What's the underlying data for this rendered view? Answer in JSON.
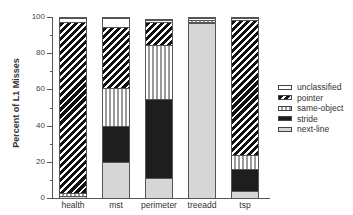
{
  "chart_data": {
    "type": "bar",
    "stacked": true,
    "title": "",
    "xlabel": "",
    "ylabel": "Percent of L1 Misses",
    "ylim": [
      0,
      100
    ],
    "yticks": [
      0,
      20,
      40,
      60,
      80,
      100
    ],
    "grid": false,
    "legend_position": "right",
    "categories": [
      "health",
      "mst",
      "perimeter",
      "treeadd",
      "tsp"
    ],
    "series": [
      {
        "name": "next-line",
        "values": [
          1,
          20,
          11,
          97,
          4
        ]
      },
      {
        "name": "stride",
        "values": [
          0,
          20,
          44,
          1,
          12
        ]
      },
      {
        "name": "same-object",
        "values": [
          2,
          21,
          30,
          1,
          8
        ]
      },
      {
        "name": "pointer",
        "values": [
          95,
          34,
          13,
          0,
          75
        ]
      },
      {
        "name": "unclassified",
        "values": [
          2,
          5,
          1,
          1,
          1
        ]
      }
    ],
    "legend": [
      "unclassified",
      "pointer",
      "same-object",
      "stride",
      "next-line"
    ]
  },
  "axis": {
    "ylabel": "Percent of L1 Misses",
    "yticks": [
      "0",
      "20",
      "40",
      "60",
      "80",
      "100"
    ]
  },
  "legend": {
    "items": [
      "unclassified",
      "pointer",
      "same-object",
      "stride",
      "next-line"
    ]
  }
}
